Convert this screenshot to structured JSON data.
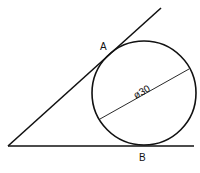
{
  "diagram": {
    "labels": {
      "point_a": "A",
      "point_b": "B",
      "diameter": "ø30"
    },
    "stroke_color": "#111111",
    "background": "#ffffff"
  }
}
